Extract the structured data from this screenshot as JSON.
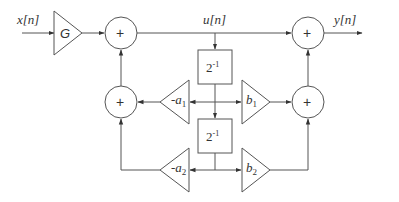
{
  "diagram": {
    "type": "signal-flow / IIR biquad block diagram",
    "signals": {
      "input": "x[n]",
      "intermediate": "u[n]",
      "output": "y[n]"
    },
    "gain_input": "G",
    "adders": [
      {
        "id": "adder-top-left",
        "symbol": "+"
      },
      {
        "id": "adder-mid-left",
        "symbol": "+"
      },
      {
        "id": "adder-top-right",
        "symbol": "+"
      },
      {
        "id": "adder-mid-right",
        "symbol": "+"
      }
    ],
    "delays": [
      {
        "id": "delay-1",
        "label_base": "2",
        "label_exp": "-1"
      },
      {
        "id": "delay-2",
        "label_base": "2",
        "label_exp": "-1"
      }
    ],
    "multipliers": {
      "feedback": [
        {
          "id": "gain-a1",
          "sign": "-",
          "name": "a",
          "sub": "1"
        },
        {
          "id": "gain-a2",
          "sign": "-",
          "name": "a",
          "sub": "2"
        }
      ],
      "feedforward": [
        {
          "id": "gain-b1",
          "name": "b",
          "sub": "1"
        },
        {
          "id": "gain-b2",
          "name": "b",
          "sub": "2"
        }
      ]
    }
  },
  "colors": {
    "line": "#555555",
    "text": "#333333",
    "background": "#ffffff"
  }
}
